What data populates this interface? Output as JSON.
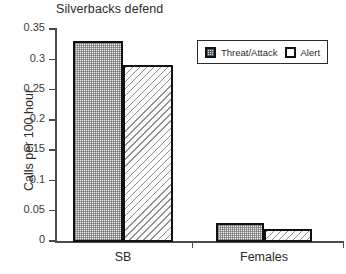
{
  "chart_data": {
    "type": "bar",
    "title": "Silverbacks defend",
    "xlabel": "",
    "ylabel": "Calls per 100 hour",
    "categories": [
      "SB",
      "Females"
    ],
    "series": [
      {
        "name": "Threat/Attack",
        "values": [
          0.33,
          0.03
        ],
        "pattern": "checkered"
      },
      {
        "name": "Alert",
        "values": [
          0.29,
          0.02
        ],
        "pattern": "diagonal-hatch"
      }
    ],
    "ylim": [
      0,
      0.35
    ],
    "ytick_labels": [
      "0.35",
      "0.3",
      "0.25",
      "0.2",
      "0.15",
      "0.1",
      "0.05",
      "0"
    ],
    "ytick_values": [
      0.35,
      0.3,
      0.25,
      0.2,
      0.15,
      0.1,
      0.05,
      0
    ],
    "grid": false,
    "legend_position": "top-right",
    "colors": {
      "bar_outline": "#111111",
      "axis": "#4a4a4a",
      "text": "#2b2b2b",
      "background": "#ffffff"
    }
  }
}
